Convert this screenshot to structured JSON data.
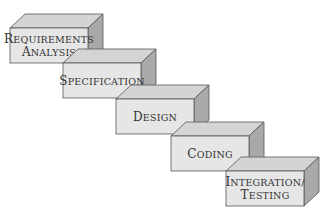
{
  "diagram": {
    "type": "waterfall-staircase",
    "colors": {
      "front": "#e6e6e6",
      "top": "#d4d4d4",
      "side": "#a9a9a9",
      "edge": "#555555",
      "text": "#333333"
    },
    "steps": [
      {
        "lines": [
          "Requirements",
          "Analysis"
        ]
      },
      {
        "lines": [
          "Specification"
        ]
      },
      {
        "lines": [
          "Design"
        ]
      },
      {
        "lines": [
          "Coding"
        ]
      },
      {
        "lines": [
          "Integration/",
          "Testing"
        ]
      }
    ]
  }
}
